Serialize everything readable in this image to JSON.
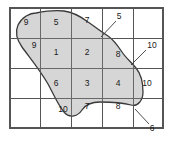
{
  "figure": {
    "title": "",
    "type": "grid-overlay-region-diagram"
  },
  "colors": {
    "region_fill": "#d6d6d6",
    "region_outline": "#3a3a3a",
    "grid_line": "#555555",
    "label_text": "#1a1a1a",
    "background": "#ffffff"
  },
  "grid": {
    "columns": 5,
    "rows": 4,
    "x_edges": [
      10,
      40,
      71,
      102,
      133,
      163
    ],
    "y_edges": [
      8,
      38,
      68,
      98,
      128
    ]
  },
  "cell_labels": [
    {
      "id": "cell-r1c1",
      "text": "9",
      "x": 26,
      "y": 23
    },
    {
      "id": "cell-r1c2",
      "text": "5",
      "x": 56,
      "y": 23
    },
    {
      "id": "cell-r1c3",
      "text": "7",
      "x": 87,
      "y": 21
    },
    {
      "id": "cell-r2c1",
      "text": "9",
      "x": 34,
      "y": 46
    },
    {
      "id": "cell-r2c2",
      "text": "1",
      "x": 56,
      "y": 53
    },
    {
      "id": "cell-r2c3",
      "text": "2",
      "x": 87,
      "y": 53
    },
    {
      "id": "cell-r2c4",
      "text": "8",
      "x": 118,
      "y": 55
    },
    {
      "id": "cell-r3c2",
      "text": "6",
      "x": 56,
      "y": 84
    },
    {
      "id": "cell-r3c3",
      "text": "3",
      "x": 87,
      "y": 84
    },
    {
      "id": "cell-r3c4",
      "text": "4",
      "x": 118,
      "y": 84
    },
    {
      "id": "cell-r3c5",
      "text": "10",
      "x": 147,
      "y": 84
    },
    {
      "id": "cell-r4c2",
      "text": "10",
      "x": 63,
      "y": 110
    },
    {
      "id": "cell-r4c3",
      "text": "7",
      "x": 87,
      "y": 107
    },
    {
      "id": "cell-r4c4",
      "text": "8",
      "x": 118,
      "y": 107
    }
  ],
  "callouts": [
    {
      "id": "callout-5",
      "text": "5",
      "label_x": 119,
      "label_y": 17,
      "leader": {
        "x1": 116,
        "y1": 21,
        "x2": 101,
        "y2": 37
      }
    },
    {
      "id": "callout-10",
      "text": "10",
      "label_x": 152,
      "label_y": 46,
      "leader": {
        "x1": 146,
        "y1": 50,
        "x2": 131,
        "y2": 65
      }
    },
    {
      "id": "callout-6",
      "text": "6",
      "label_x": 152,
      "label_y": 129,
      "leader": {
        "x1": 149,
        "y1": 124,
        "x2": 135,
        "y2": 109
      }
    }
  ],
  "region_outline_path": "M 36,13 C 30,13 22,17 18,25 C 15,32 17,40 22,47 C 30,58 40,70 48,84 C 54,95 58,105 64,112 C 70,119 78,116 82,110 C 86,104 92,102 100,102 C 112,102 124,103 131,105 C 138,107 143,100 143,92 C 143,82 141,74 136,68 C 131,62 126,58 122,52 C 118,46 114,40 108,36 C 100,31 94,26 88,22 C 80,16 72,12 64,11 C 56,10 46,11 36,13 Z"
}
